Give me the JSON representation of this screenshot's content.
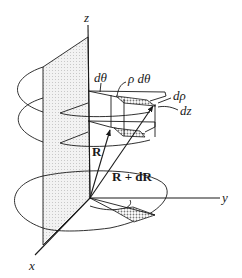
{
  "figure": {
    "type": "cylindrical-coordinates-volume-element",
    "labels": {
      "z_axis": "z",
      "y_axis": "y",
      "x_axis": "x",
      "d_theta": "dθ",
      "rho_d_theta": "ρ dθ",
      "d_rho": "dρ",
      "dz": "dz",
      "R": "R",
      "R_plus_dR": "R + dR"
    },
    "colors": {
      "line": "#1a1a1a",
      "plane_fill": "#e6e6e6",
      "element_fill": "#bdbdbd"
    }
  }
}
